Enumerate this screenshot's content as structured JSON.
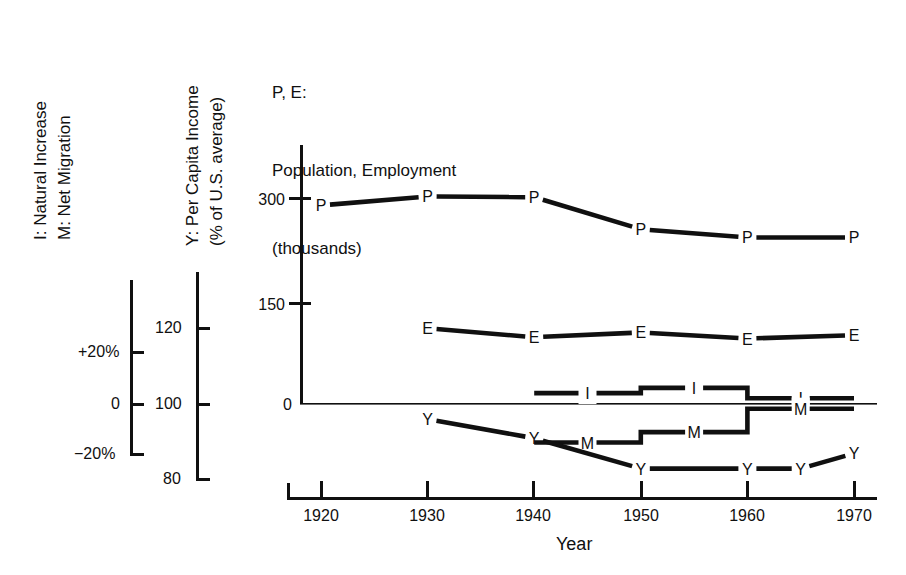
{
  "legend_left": {
    "axis_title_line1": "I: Natural Increase",
    "axis_title_line2": "M: Net Migration",
    "ticks": [
      {
        "label": "+20%",
        "value": 20
      },
      {
        "label": "0",
        "value": 0
      },
      {
        "label": "−20%",
        "value": -20
      }
    ]
  },
  "legend_income": {
    "axis_title_line1": "Y: Per Capita Income",
    "axis_title_line2": "(% of U.S. average)",
    "ticks": [
      {
        "label": "120",
        "value": 120
      },
      {
        "label": "100",
        "value": 100
      },
      {
        "label": "80",
        "value": 80
      }
    ]
  },
  "title": {
    "line1": "P, E:",
    "line2": "Population, Employment",
    "line3": "(thousands)"
  },
  "axes": {
    "x_title": "Year",
    "x_ticks": [
      "1920",
      "1930",
      "1940",
      "1950",
      "1960",
      "1970"
    ],
    "y_left_ticks": [
      "300",
      "150",
      "0"
    ]
  },
  "chart_data": {
    "type": "line",
    "title": "P, E: Population, Employment (thousands)",
    "xlabel": "Year",
    "ylabel": "Population, Employment (thousands)",
    "xlim": [
      1918,
      1971
    ],
    "grid": false,
    "legend": "inline-point-labels",
    "x": [
      1920,
      1930,
      1940,
      1950,
      1960,
      1970
    ],
    "series": [
      {
        "name": "P",
        "description": "Population (thousands)",
        "axis": "population",
        "point_label": "P",
        "x": [
          1920,
          1930,
          1940,
          1950,
          1960,
          1970
        ],
        "values": [
          290,
          303,
          302,
          255,
          243,
          243
        ]
      },
      {
        "name": "E",
        "description": "Employment (thousands)",
        "axis": "population",
        "point_label": "E",
        "x": [
          1930,
          1940,
          1950,
          1960,
          1970
        ],
        "values": [
          110,
          97,
          104,
          95,
          100
        ]
      },
      {
        "name": "I",
        "description": "Natural Increase (% per decade)",
        "axis": "percent",
        "point_label": "I",
        "type": "step",
        "x": [
          1940,
          1950,
          1960,
          1970
        ],
        "values": [
          4.0,
          6.0,
          6.0,
          2.0
        ],
        "steps": [
          {
            "from": 1940,
            "to": 1950,
            "value": 4.0
          },
          {
            "from": 1950,
            "to": 1960,
            "value": 6.0
          },
          {
            "from": 1960,
            "to": 1970,
            "value": 2.0
          }
        ]
      },
      {
        "name": "M",
        "description": "Net Migration (% per decade)",
        "axis": "percent",
        "point_label": "M",
        "type": "step",
        "x": [
          1940,
          1950,
          1960,
          1970
        ],
        "values": [
          -15.0,
          -11.0,
          -2.0,
          -2.0
        ],
        "steps": [
          {
            "from": 1940,
            "to": 1950,
            "value": -15.0
          },
          {
            "from": 1950,
            "to": 1960,
            "value": -11.0
          },
          {
            "from": 1960,
            "to": 1970,
            "value": -2.0
          }
        ]
      },
      {
        "name": "Y",
        "description": "Per Capita Income (% of U.S. average)",
        "axis": "income",
        "point_label": "Y",
        "x": [
          1930,
          1940,
          1950,
          1960,
          1965,
          1970
        ],
        "values": [
          96,
          91,
          83,
          83,
          83,
          87
        ]
      }
    ]
  }
}
